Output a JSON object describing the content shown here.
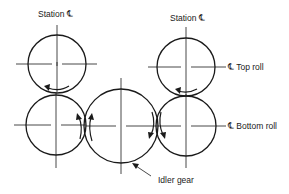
{
  "diagram": {
    "labels": {
      "station_left": "Station ℄",
      "station_right": "Station ℄",
      "top_roll": "℄ Top roll",
      "bottom_roll": "℄ Bottom roll",
      "idler_gear": "Idler gear"
    },
    "components": [
      {
        "id": "top-roll-left",
        "name": "Top roll (left station)",
        "cx": 57,
        "cy": 64,
        "r": 29
      },
      {
        "id": "top-roll-right",
        "name": "Top roll (right station)",
        "cx": 186,
        "cy": 67,
        "r": 29
      },
      {
        "id": "bottom-roll-left",
        "name": "Bottom roll (left station)",
        "cx": 56,
        "cy": 125,
        "r": 30
      },
      {
        "id": "idler-gear",
        "name": "Idler gear",
        "cx": 121,
        "cy": 126,
        "r": 37
      },
      {
        "id": "bottom-roll-right",
        "name": "Bottom roll (right station)",
        "cx": 186,
        "cy": 126,
        "r": 30
      }
    ],
    "rotation_arrows": [
      "top-left roll: counterclockwise arrow at bottom",
      "top-right roll: counterclockwise arrow at bottom",
      "left mesh: two upward arrows",
      "right mesh: two downward arrows"
    ],
    "colors": {
      "line": "#1a1a1a",
      "background": "#ffffff"
    }
  }
}
